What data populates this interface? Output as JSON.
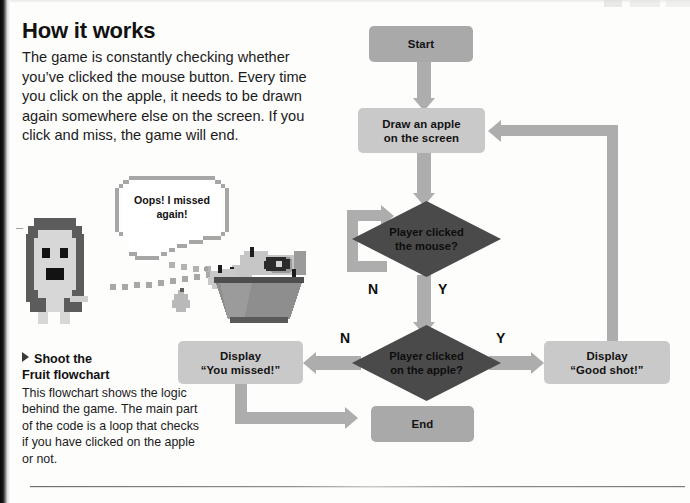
{
  "article": {
    "heading": "How it works",
    "intro": "The game is constantly checking whether you’ve clicked the mouse button. Every time you click on the apple, it needs to be drawn again somewhere else on the screen. If you click and miss, the game will end."
  },
  "caption": {
    "title_line1": "Shoot the",
    "title_line2": "Fruit flowchart",
    "body": "This flowchart shows the logic behind the game. The main part of the code is a loop that checks if you have clicked on the apple or not."
  },
  "illustration": {
    "speech_bubble_line1": "Oops! I missed",
    "speech_bubble_line2": "again!",
    "character": "pixel-girl-sprite",
    "fruit": "pixel-fruit-bowl-sprite",
    "projectile": "pixel-pear-sprite",
    "trajectory": "dotted-trajectory"
  },
  "flowchart": {
    "nodes": [
      {
        "id": "start",
        "label": "Start",
        "shape": "rounded-box",
        "fill": "#a9a9a9"
      },
      {
        "id": "draw-apple",
        "label": "Draw an apple\non the screen",
        "line1": "Draw an apple",
        "line2": "on the screen",
        "shape": "box",
        "fill": "#c9c9c9"
      },
      {
        "id": "clicked-mouse",
        "line1": "Player clicked",
        "line2": "the mouse?",
        "shape": "diamond",
        "fill": "#4a4a4a"
      },
      {
        "id": "clicked-apple",
        "line1": "Player clicked",
        "line2": "on the apple?",
        "shape": "diamond",
        "fill": "#4a4a4a"
      },
      {
        "id": "display-missed",
        "line1": "Display",
        "line2": "“You missed!”",
        "shape": "box",
        "fill": "#c9c9c9"
      },
      {
        "id": "display-good",
        "line1": "Display",
        "line2": "“Good shot!”",
        "shape": "box",
        "fill": "#c9c9c9"
      },
      {
        "id": "end",
        "label": "End",
        "shape": "rounded-box",
        "fill": "#a9a9a9"
      }
    ],
    "branch_labels": {
      "mouse_no": "N",
      "mouse_yes": "Y",
      "apple_no": "N",
      "apple_yes": "Y"
    },
    "edges": [
      {
        "from": "start",
        "to": "draw-apple",
        "label": ""
      },
      {
        "from": "draw-apple",
        "to": "clicked-mouse",
        "label": ""
      },
      {
        "from": "clicked-mouse",
        "to": "clicked-mouse",
        "label": "N"
      },
      {
        "from": "clicked-mouse",
        "to": "clicked-apple",
        "label": "Y"
      },
      {
        "from": "clicked-apple",
        "to": "display-missed",
        "label": "N"
      },
      {
        "from": "clicked-apple",
        "to": "display-good",
        "label": "Y"
      },
      {
        "from": "display-missed",
        "to": "end",
        "label": ""
      },
      {
        "from": "display-good",
        "to": "draw-apple",
        "label": ""
      }
    ],
    "colors": {
      "arrow": "#adadad",
      "process_fill": "#c9c9c9",
      "terminator_fill": "#a9a9a9",
      "decision_fill": "#4a4a4a",
      "text": "#121212"
    }
  }
}
